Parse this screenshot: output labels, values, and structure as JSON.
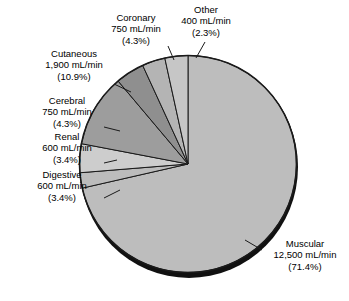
{
  "chart_data": {
    "type": "pie",
    "title": "",
    "subtitle": "",
    "xlabel": "",
    "ylabel": "",
    "units": "mL/min",
    "total": 17500,
    "legend_position": "callout-labels",
    "grid": false,
    "start_angle_deg": 0,
    "direction": "clockwise",
    "categories": [
      "Muscular",
      "Cutaneous",
      "Coronary",
      "Other",
      "Cerebral",
      "Renal",
      "Digestive"
    ],
    "values": [
      12500,
      1900,
      750,
      400,
      750,
      600,
      600
    ],
    "percents": [
      71.4,
      10.9,
      4.3,
      2.3,
      4.3,
      3.4,
      3.4
    ],
    "slices": [
      {
        "name": "Muscular",
        "value": 12500,
        "value_text": "12,500 mL/min",
        "percent": 71.4,
        "percent_text": "(71.4%)",
        "color": "#bdbdbd"
      },
      {
        "name": "Other",
        "value": 400,
        "value_text": "400 mL/min",
        "percent": 2.3,
        "percent_text": "(2.3%)",
        "color": "#bcbcbc"
      },
      {
        "name": "Coronary",
        "value": 750,
        "value_text": "750 mL/min",
        "percent": 4.3,
        "percent_text": "(4.3%)",
        "color": "#cdcdcd"
      },
      {
        "name": "Cutaneous",
        "value": 1900,
        "value_text": "1,900 mL/min",
        "percent": 10.9,
        "percent_text": "(10.9%)",
        "color": "#9d9d9d"
      },
      {
        "name": "Cerebral",
        "value": 750,
        "value_text": "750 mL/min",
        "percent": 4.3,
        "percent_text": "(4.3%)",
        "color": "#8f8f8f"
      },
      {
        "name": "Renal",
        "value": 600,
        "value_text": "600 mL/min",
        "percent": 3.4,
        "percent_text": "(3.4%)",
        "color": "#b4b4b4"
      },
      {
        "name": "Digestive",
        "value": 600,
        "value_text": "600 mL/min",
        "percent": 3.4,
        "percent_text": "(3.4%)",
        "color": "#c6c6c6"
      }
    ]
  },
  "labels": {
    "coronary": {
      "name": "Coronary",
      "value_text": "750 mL/min",
      "percent_text": "(4.3%)"
    },
    "other": {
      "name": "Other",
      "value_text": "400 mL/min",
      "percent_text": "(2.3%)"
    },
    "cutaneous": {
      "name": "Cutaneous",
      "value_text": "1,900 mL/min",
      "percent_text": "(10.9%)"
    },
    "cerebral": {
      "name": "Cerebral",
      "value_text": "750 mL/min",
      "percent_text": "(4.3%)"
    },
    "renal": {
      "name": "Renal",
      "value_text": "600 mL/min",
      "percent_text": "(3.4%)"
    },
    "digestive": {
      "name": "Digestive",
      "value_text": "600 mL/min",
      "percent_text": "(3.4%)"
    },
    "muscular": {
      "name": "Muscular",
      "value_text": "12,500 mL/min",
      "percent_text": "(71.4%)"
    }
  },
  "style": {
    "background": "#ffffff",
    "outline": "#1a1a1a",
    "shadow": "#111111",
    "text": "#000000"
  }
}
